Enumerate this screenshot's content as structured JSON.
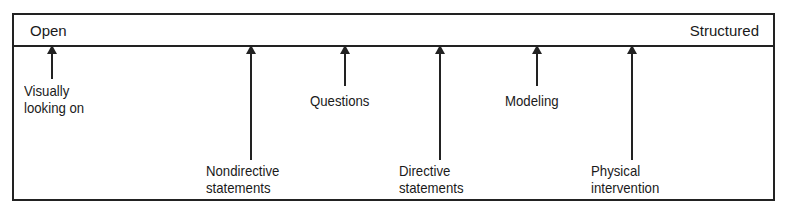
{
  "diagram": {
    "type": "continuum",
    "left_end": "Open",
    "right_end": "Structured",
    "items": [
      {
        "label": "Visually\nlooking on",
        "x": 52,
        "arrow_len": 33,
        "label_x": 24,
        "label_y": 82
      },
      {
        "label": "Nondirective\nstatements",
        "x": 251,
        "arrow_len": 114,
        "label_x": 206,
        "label_y": 162
      },
      {
        "label": "Questions",
        "x": 345,
        "arrow_len": 40,
        "label_x": 310,
        "label_y": 92
      },
      {
        "label": "Directive\nstatements",
        "x": 440,
        "arrow_len": 114,
        "label_x": 399,
        "label_y": 162
      },
      {
        "label": "Modeling",
        "x": 537,
        "arrow_len": 40,
        "label_x": 505,
        "label_y": 92
      },
      {
        "label": "Physical\nintervention",
        "x": 632,
        "arrow_len": 114,
        "label_x": 591,
        "label_y": 162
      }
    ]
  }
}
